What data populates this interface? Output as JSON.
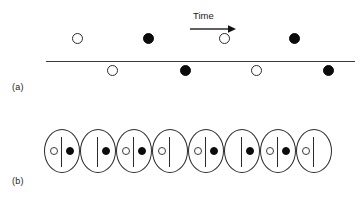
{
  "figure": {
    "width": 362,
    "height": 203,
    "background": "#ffffff",
    "ink": "#1a1a1a"
  },
  "panel_a": {
    "label": "(a)",
    "time_axis": {
      "label": "Time",
      "arrow_direction": "right",
      "arrow_name": "time-arrow-right"
    },
    "axis_line": {
      "x_start": 46,
      "x_end": 355,
      "y": 61
    },
    "events_above": [
      {
        "marker": "open",
        "x": 77,
        "y": 38
      },
      {
        "marker": "filled",
        "x": 148,
        "y": 38
      },
      {
        "marker": "open",
        "x": 224,
        "y": 38
      },
      {
        "marker": "filled",
        "x": 294,
        "y": 38
      }
    ],
    "events_below": [
      {
        "marker": "open",
        "x": 112,
        "y": 70
      },
      {
        "marker": "filled",
        "x": 185,
        "y": 70
      },
      {
        "marker": "open",
        "x": 256,
        "y": 70
      },
      {
        "marker": "filled",
        "x": 328,
        "y": 70
      }
    ]
  },
  "panel_b": {
    "label": "(b)",
    "capsules": [
      {
        "index": 1,
        "x": 44,
        "left": "open",
        "right": "filled"
      },
      {
        "index": 2,
        "x": 80,
        "left": "empty",
        "right": "filled"
      },
      {
        "index": 3,
        "x": 116,
        "left": "open",
        "right": "filled"
      },
      {
        "index": 4,
        "x": 152,
        "left": "open",
        "right": "empty"
      },
      {
        "index": 5,
        "x": 188,
        "left": "open",
        "right": "filled"
      },
      {
        "index": 6,
        "x": 224,
        "left": "empty",
        "right": "filled"
      },
      {
        "index": 7,
        "x": 260,
        "left": "open",
        "right": "filled"
      },
      {
        "index": 8,
        "x": 296,
        "left": "open",
        "right": "empty"
      }
    ]
  }
}
